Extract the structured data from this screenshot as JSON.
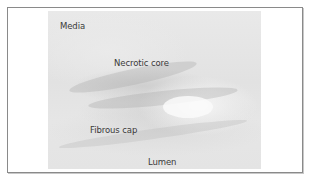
{
  "figure": {
    "type": "histology micrograph",
    "labels": {
      "media": "Media",
      "necrotic_core": "Necrotic core",
      "fibrous_cap": "Fibrous cap",
      "lumen": "Lumen"
    },
    "colors": {
      "border": "#8a8a8a",
      "tissue_background": "#e4e4e4",
      "label_text": "#3a3a3a"
    }
  }
}
